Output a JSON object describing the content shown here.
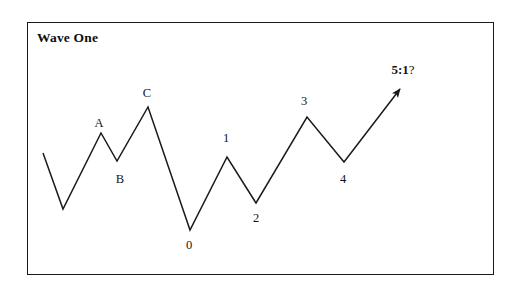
{
  "figure": {
    "title": "Wave One",
    "border_color": "#1a1a1a",
    "line_color": "#1a1a1a",
    "background": "#ffffff"
  },
  "labels": [
    {
      "id": "label-a",
      "text": "A",
      "x": 99,
      "y": 116
    },
    {
      "id": "label-b",
      "text": "B",
      "x": 120,
      "y": 172
    },
    {
      "id": "label-c",
      "text": "C",
      "x": 147,
      "y": 86
    },
    {
      "id": "label-0",
      "text": "0",
      "x": 189,
      "y": 238
    },
    {
      "id": "label-1",
      "text": "1",
      "x": 226,
      "y": 131
    },
    {
      "id": "label-2",
      "text": "2",
      "x": 256,
      "y": 211
    },
    {
      "id": "label-3",
      "text": "3",
      "x": 304,
      "y": 94
    },
    {
      "id": "label-4",
      "text": "4",
      "x": 343,
      "y": 172
    }
  ],
  "ratio_label": {
    "bold": "5:1",
    "question": "?",
    "x": 403,
    "y": 62
  },
  "chart_data": {
    "type": "line",
    "title": "Wave One",
    "xlabel": "",
    "ylabel": "",
    "grid": false,
    "legend": "none",
    "annotation": "5:1?",
    "points": [
      {
        "label": "",
        "x": 43,
        "y": 153
      },
      {
        "label": "",
        "x": 63,
        "y": 209
      },
      {
        "label": "A",
        "x": 101,
        "y": 133
      },
      {
        "label": "B",
        "x": 117,
        "y": 161
      },
      {
        "label": "C",
        "x": 148,
        "y": 107
      },
      {
        "label": "0",
        "x": 190,
        "y": 230
      },
      {
        "label": "1",
        "x": 227,
        "y": 157
      },
      {
        "label": "2",
        "x": 256,
        "y": 203
      },
      {
        "label": "3",
        "x": 307,
        "y": 117
      },
      {
        "label": "4",
        "x": 344,
        "y": 162
      },
      {
        "label": "5:1?",
        "x": 400,
        "y": 89
      }
    ],
    "polyline": "43,153 63,209 101,133 117,161 148,107 190,230 227,157 256,203 307,117 344,162 400,89"
  }
}
